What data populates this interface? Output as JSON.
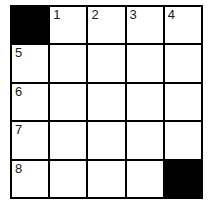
{
  "puzzle": {
    "rows": 5,
    "cols": 5,
    "colors": {
      "block": "#000000",
      "cell": "#ffffff",
      "line": "#000000"
    },
    "cells": [
      [
        {
          "type": "block"
        },
        {
          "type": "open",
          "number": "1"
        },
        {
          "type": "open",
          "number": "2"
        },
        {
          "type": "open",
          "number": "3"
        },
        {
          "type": "open",
          "number": "4"
        }
      ],
      [
        {
          "type": "open",
          "number": "5"
        },
        {
          "type": "open"
        },
        {
          "type": "open"
        },
        {
          "type": "open"
        },
        {
          "type": "open"
        }
      ],
      [
        {
          "type": "open",
          "number": "6"
        },
        {
          "type": "open"
        },
        {
          "type": "open"
        },
        {
          "type": "open"
        },
        {
          "type": "open"
        }
      ],
      [
        {
          "type": "open",
          "number": "7"
        },
        {
          "type": "open"
        },
        {
          "type": "open"
        },
        {
          "type": "open"
        },
        {
          "type": "open"
        }
      ],
      [
        {
          "type": "open",
          "number": "8"
        },
        {
          "type": "open"
        },
        {
          "type": "open"
        },
        {
          "type": "open"
        },
        {
          "type": "block"
        }
      ]
    ]
  }
}
